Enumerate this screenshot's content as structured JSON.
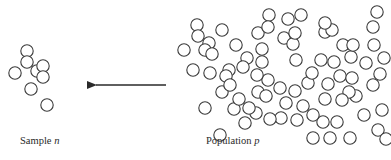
{
  "diagram": {
    "type": "sampling-illustration",
    "colors": {
      "stroke": "#3a3a3a",
      "background": "#ffffff",
      "arrow": "#2a2a2a"
    },
    "circle_radius": 6.2,
    "sample": {
      "label_text": "Sample",
      "label_var": "n",
      "circles": [
        [
          27,
          51
        ],
        [
          27,
          62
        ],
        [
          15,
          73
        ],
        [
          37,
          71
        ],
        [
          43,
          66
        ],
        [
          43,
          77
        ],
        [
          31,
          89
        ],
        [
          47,
          105
        ]
      ]
    },
    "arrow": {
      "direction": "left",
      "from": [
        166,
        85
      ],
      "to": [
        87,
        85
      ]
    },
    "population": {
      "label_text": "Population",
      "label_var": "p",
      "circles": [
        [
          197,
          25
        ],
        [
          198,
          36
        ],
        [
          222,
          30
        ],
        [
          184,
          50
        ],
        [
          209,
          43
        ],
        [
          205,
          50
        ],
        [
          212,
          54
        ],
        [
          236,
          45
        ],
        [
          258,
          33
        ],
        [
          269,
          15
        ],
        [
          268,
          27
        ],
        [
          288,
          19
        ],
        [
          284,
          38
        ],
        [
          293,
          44
        ],
        [
          295,
          33
        ],
        [
          262,
          49
        ],
        [
          262,
          62
        ],
        [
          247,
          58
        ],
        [
          243,
          67
        ],
        [
          229,
          70
        ],
        [
          226,
          76
        ],
        [
          301,
          15
        ],
        [
          325,
          32
        ],
        [
          332,
          30
        ],
        [
          325,
          23
        ],
        [
          343,
          45
        ],
        [
          351,
          57
        ],
        [
          353,
          45
        ],
        [
          321,
          60
        ],
        [
          334,
          62
        ],
        [
          373,
          27
        ],
        [
          374,
          45
        ],
        [
          377,
          12
        ],
        [
          384,
          58
        ],
        [
          380,
          74
        ],
        [
          373,
          85
        ],
        [
          366,
          63
        ],
        [
          340,
          76
        ],
        [
          352,
          78
        ],
        [
          356,
          96
        ],
        [
          349,
          92
        ],
        [
          342,
          100
        ],
        [
          364,
          115
        ],
        [
          382,
          110
        ],
        [
          378,
          130
        ],
        [
          386,
          139
        ],
        [
          350,
          138
        ],
        [
          323,
          122
        ],
        [
          330,
          138
        ],
        [
          313,
          138
        ],
        [
          337,
          122
        ],
        [
          325,
          99
        ],
        [
          328,
          84
        ],
        [
          308,
          83
        ],
        [
          295,
          91
        ],
        [
          286,
          103
        ],
        [
          268,
          80
        ],
        [
          280,
          88
        ],
        [
          296,
          60
        ],
        [
          312,
          73
        ],
        [
          281,
          118
        ],
        [
          234,
          109
        ],
        [
          270,
          119
        ],
        [
          256,
          113
        ],
        [
          249,
          108
        ],
        [
          245,
          123
        ],
        [
          239,
          99
        ],
        [
          222,
          92
        ],
        [
          205,
          108
        ],
        [
          220,
          135
        ],
        [
          258,
          92
        ],
        [
          266,
          96
        ],
        [
          230,
          85
        ],
        [
          257,
          75
        ],
        [
          193,
          70
        ],
        [
          210,
          73
        ],
        [
          303,
          106
        ],
        [
          313,
          115
        ],
        [
          297,
          120
        ]
      ]
    }
  }
}
